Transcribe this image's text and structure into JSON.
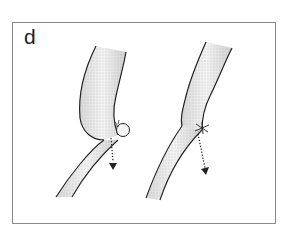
{
  "figure": {
    "panel_label": "d",
    "illustrations": [
      {
        "id": "left",
        "description": "Vessel with bulging segment and small spherical protrusion at junction, dotted arrow pointing down"
      },
      {
        "id": "right",
        "description": "Vessel with narrowed ligated junction (suture), dotted arrow pointing down"
      }
    ],
    "colors": {
      "stroke": "#222222",
      "frame": "#8a8a8a",
      "stipple": "#9a9a9a"
    }
  }
}
